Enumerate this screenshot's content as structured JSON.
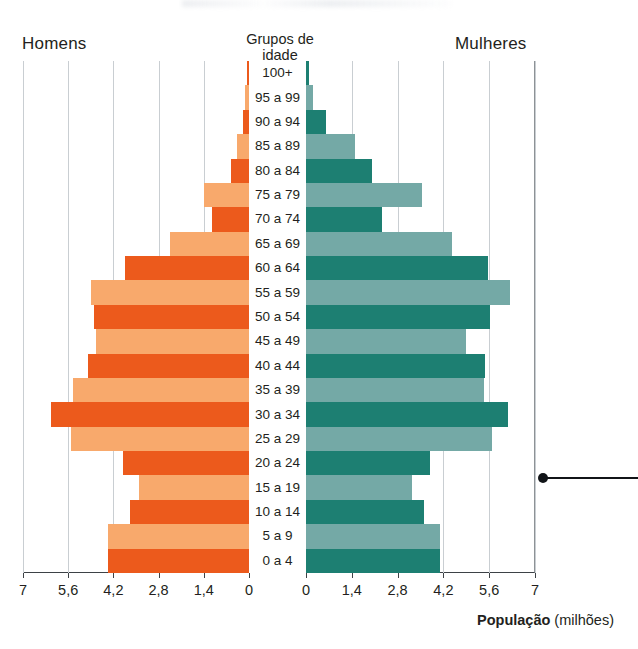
{
  "headings": {
    "men": "Homens",
    "women": "Mulheres",
    "center_line1": "Grupos de",
    "center_line2": "idade"
  },
  "axis": {
    "caption_bold": "População",
    "caption_rest": " (milhões)",
    "left_ticks": [
      "7",
      "5,6",
      "4,2",
      "2,8",
      "1,4",
      "0"
    ],
    "right_ticks": [
      "0",
      "1,4",
      "2,8",
      "4,2",
      "5,6",
      "7"
    ]
  },
  "colors": {
    "men_dark": "#ec5a1c",
    "men_light": "#f8a96c",
    "women_dark": "#1d7f72",
    "women_light": "#74a9a6",
    "grid": "#c9ced2",
    "axis": "#3d4246"
  },
  "chart_data": {
    "type": "bar",
    "title": "",
    "subtype": "population-pyramid",
    "xlabel": "População (milhões)",
    "ylabel": "Grupos de idade",
    "xlim": [
      0,
      7
    ],
    "xticks": [
      0,
      1.4,
      2.8,
      4.2,
      5.6,
      7
    ],
    "grid": true,
    "legend": "none",
    "categories": [
      "100+",
      "95 a 99",
      "90 a 94",
      "85 a 89",
      "80 a 84",
      "75 a 79",
      "70 a 74",
      "65 a 69",
      "60 a 64",
      "55 a 59",
      "50 a 54",
      "45 a 49",
      "40 a 44",
      "35 a 39",
      "30 a 34",
      "25 a 29",
      "20 a 24",
      "15 a 19",
      "10 a 14",
      "5 a 9",
      "0 a 4"
    ],
    "series": [
      {
        "name": "Homens",
        "side": "left",
        "values": [
          0.06,
          0.11,
          0.2,
          0.36,
          0.55,
          1.38,
          1.16,
          2.46,
          3.85,
          4.9,
          4.81,
          4.75,
          5.0,
          5.46,
          6.14,
          5.5,
          3.89,
          3.42,
          3.7,
          4.38,
          4.38
        ]
      },
      {
        "name": "Mulheres",
        "side": "right",
        "values": [
          0.09,
          0.22,
          0.62,
          1.5,
          2.01,
          3.54,
          2.33,
          4.47,
          5.55,
          6.24,
          5.63,
          4.9,
          5.48,
          5.45,
          6.18,
          5.69,
          3.8,
          3.25,
          3.62,
          4.11,
          4.11
        ]
      }
    ]
  },
  "annotation": {
    "leader_line": "callout-leader-line"
  }
}
